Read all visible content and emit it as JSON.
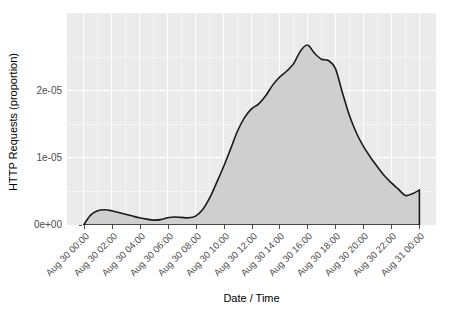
{
  "chart_data": {
    "type": "area",
    "title": "",
    "xlabel": "Date / Time",
    "ylabel": "HTTP Requests (proportion)",
    "theme": "ggplot2-gray",
    "panel_background": "#ebebeb",
    "grid_color": "#ffffff",
    "area_fill": "#cfcfcf",
    "line_color": "#1a1a1a",
    "grid": true,
    "legend": "none",
    "xlim": [
      "Aug 30 00:00",
      "Aug 31 00:00"
    ],
    "ylim": [
      0,
      3e-05
    ],
    "y_tick_labels": [
      "0e+00",
      "1e-05",
      "2e-05"
    ],
    "y_tick_values": [
      0,
      1e-05,
      2e-05
    ],
    "x_tick_labels": [
      "Aug 30 00:00",
      "Aug 30 02:00",
      "Aug 30 04:00",
      "Aug 30 06:00",
      "Aug 30 08:00",
      "Aug 30 10:00",
      "Aug 30 12:00",
      "Aug 30 14:00",
      "Aug 30 16:00",
      "Aug 30 18:00",
      "Aug 30 20:00",
      "Aug 30 22:00",
      "Aug 31 00:00"
    ],
    "x_hours": [
      0,
      2,
      4,
      6,
      8,
      10,
      12,
      14,
      16,
      18,
      20,
      22,
      24
    ],
    "x": [
      0.0,
      0.5,
      1.0,
      1.5,
      2.0,
      2.5,
      3.0,
      3.5,
      4.0,
      4.5,
      5.0,
      5.5,
      6.0,
      6.5,
      7.0,
      7.5,
      8.0,
      8.5,
      9.0,
      9.5,
      10.0,
      10.5,
      11.0,
      11.5,
      12.0,
      12.5,
      13.0,
      13.5,
      14.0,
      14.5,
      15.0,
      15.5,
      16.0,
      16.5,
      17.0,
      17.5,
      18.0,
      18.5,
      19.0,
      19.5,
      20.0,
      20.5,
      21.0,
      21.5,
      22.0,
      22.5,
      23.0,
      23.5,
      24.0
    ],
    "values": [
      0.0,
      1.47e-06,
      2.13e-06,
      2.27e-06,
      2.13e-06,
      1.87e-06,
      1.6e-06,
      1.33e-06,
      1.07e-06,
      8.7e-07,
      7.3e-07,
      8e-07,
      1.07e-06,
      1.2e-06,
      1.13e-06,
      1.07e-06,
      1.33e-06,
      2.27e-06,
      4e-06,
      6.27e-06,
      8.67e-06,
      1.13e-05,
      1.4e-05,
      1.6e-05,
      1.73e-05,
      1.8e-05,
      1.92e-05,
      2.08e-05,
      2.2e-05,
      2.29e-05,
      2.4e-05,
      2.59e-05,
      2.68e-05,
      2.56e-05,
      2.47e-05,
      2.45e-05,
      2.33e-05,
      1.97e-05,
      1.63e-05,
      1.37e-05,
      1.17e-05,
      1.01e-05,
      8.67e-06,
      7.33e-06,
      6.27e-06,
      5.33e-06,
      4.4e-06,
      4.67e-06,
      5.2e-06
    ],
    "peak": {
      "x_hour": 16.0,
      "x_label": "Aug 30 16:00",
      "value": 2.68e-05
    },
    "minimum": {
      "x_hour": 5.0,
      "x_label": "Aug 30 05:00",
      "value": 7.3e-07
    }
  }
}
